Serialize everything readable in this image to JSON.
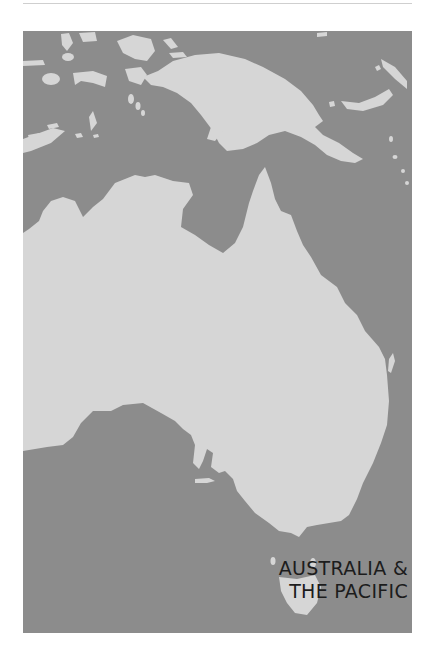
{
  "map": {
    "title_line1": "AUSTRALIA &",
    "title_line2": "THE PACIFIC",
    "colors": {
      "sea": "#8c8c8c",
      "land": "#d6d6d6",
      "title_text": "#1c1c1c",
      "rule": "#cfcfcf"
    },
    "regions": [
      "Australia",
      "New Guinea",
      "Tasmania",
      "Indonesian islands",
      "Solomon Islands"
    ]
  }
}
